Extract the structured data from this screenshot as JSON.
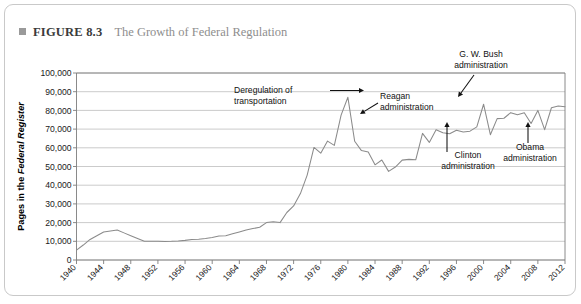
{
  "figure": {
    "marker": "square-bullet",
    "number": "FIGURE 8.3",
    "title": "The Growth of Federal Regulation"
  },
  "axes": {
    "y_title_part1": "Pages in the ",
    "y_title_part2": "Federal Register",
    "y_ticks": [
      "0",
      "10,000",
      "20,000",
      "30,000",
      "40,000",
      "50,000",
      "60,000",
      "70,000",
      "80,000",
      "90,000",
      "100,000"
    ],
    "x_ticks": [
      "1940",
      "1944",
      "1948",
      "1952",
      "1956",
      "1960",
      "1964",
      "1968",
      "1972",
      "1976",
      "1980",
      "1984",
      "1988",
      "1992",
      "1996",
      "2000",
      "2004",
      "2008",
      "2012"
    ]
  },
  "annotations": [
    {
      "id": "deregulation",
      "line1": "Deregulation of",
      "line2": "transportation"
    },
    {
      "id": "reagan",
      "line1": "Reagan",
      "line2": "administration"
    },
    {
      "id": "gwbush",
      "line1": "G. W. Bush",
      "line2": "administration"
    },
    {
      "id": "clinton",
      "line1": "Clinton",
      "line2": "administration"
    },
    {
      "id": "obama",
      "line1": "Obama",
      "line2": "administration"
    }
  ],
  "colors": {
    "line": "#8b8b8b",
    "grid": "#b4b4b4",
    "axis": "#7d7d7d",
    "frame": "#c9c9c9",
    "title_muted": "#8e8e8e"
  },
  "chart_data": {
    "type": "line",
    "title": "The Growth of Federal Regulation",
    "xlabel": "",
    "ylabel": "Pages in the Federal Register",
    "xlim": [
      1940,
      2012
    ],
    "ylim": [
      0,
      100000
    ],
    "grid": true,
    "legend": "none",
    "x": [
      1940,
      1941,
      1942,
      1943,
      1944,
      1945,
      1946,
      1947,
      1948,
      1949,
      1950,
      1951,
      1952,
      1953,
      1954,
      1955,
      1956,
      1957,
      1958,
      1959,
      1960,
      1961,
      1962,
      1963,
      1964,
      1965,
      1966,
      1967,
      1968,
      1969,
      1970,
      1971,
      1972,
      1973,
      1974,
      1975,
      1976,
      1977,
      1978,
      1979,
      1980,
      1981,
      1982,
      1983,
      1984,
      1985,
      1986,
      1987,
      1988,
      1989,
      1990,
      1991,
      1992,
      1993,
      1994,
      1995,
      1996,
      1997,
      1998,
      1999,
      2000,
      2001,
      2002,
      2003,
      2004,
      2005,
      2006,
      2007,
      2008,
      2009,
      2010,
      2011,
      2012
    ],
    "values": [
      5300,
      8000,
      11000,
      13000,
      15000,
      15500,
      16000,
      14500,
      13000,
      11500,
      10000,
      10000,
      10000,
      9900,
      10000,
      10200,
      10500,
      11000,
      11100,
      11500,
      12000,
      12800,
      13000,
      14000,
      15000,
      16000,
      16800,
      17500,
      20000,
      20500,
      20000,
      25400,
      28900,
      35500,
      45400,
      60200,
      57100,
      63600,
      61300,
      77500,
      87000,
      63500,
      58500,
      57700,
      50900,
      53500,
      47400,
      49700,
      53400,
      53800,
      53600,
      67700,
      62900,
      69700,
      68100,
      67500,
      69400,
      68500,
      68900,
      71200,
      83300,
      67000,
      75600,
      75800,
      78800,
      77700,
      78700,
      73000,
      80000,
      69700,
      81400,
      82400,
      82000
    ]
  }
}
